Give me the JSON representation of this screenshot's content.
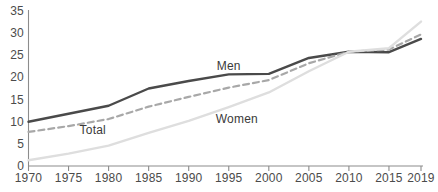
{
  "chart_data": {
    "type": "line",
    "title": "",
    "subtitle": "",
    "xlabel": "",
    "ylabel": "",
    "xlim": [
      1970,
      2019
    ],
    "ylim": [
      0,
      35
    ],
    "grid": false,
    "legend_position": "inline-annotations",
    "x": [
      1970,
      1975,
      1980,
      1985,
      1990,
      1995,
      2000,
      2005,
      2010,
      2015,
      2019
    ],
    "xtick_labels": [
      "1970",
      "1975",
      "1980",
      "1985",
      "1990",
      "1995",
      "2000",
      "2005",
      "2010",
      "2015",
      "2019"
    ],
    "ytick_labels": [
      "0",
      "5",
      "10",
      "15",
      "20",
      "25",
      "30",
      "35"
    ],
    "yticks": [
      0,
      5,
      10,
      15,
      20,
      25,
      30,
      35
    ],
    "series": [
      {
        "name": "Men",
        "style": "solid",
        "color": "#4a4a4a",
        "width": 2.4,
        "label_text": "Men",
        "values": [
          10.0,
          11.8,
          13.6,
          17.5,
          19.2,
          20.7,
          20.8,
          24.4,
          25.8,
          25.7,
          28.7
        ]
      },
      {
        "name": "Total",
        "style": "dashed",
        "color": "#a8a8a8",
        "width": 2.2,
        "label_text": "Total",
        "values": [
          7.7,
          9.0,
          10.6,
          13.4,
          15.6,
          17.7,
          19.4,
          23.2,
          25.8,
          26.3,
          29.7
        ]
      },
      {
        "name": "Women",
        "style": "solid",
        "color": "#dedede",
        "width": 2.4,
        "label_text": "Women",
        "values": [
          1.3,
          2.8,
          4.6,
          7.5,
          10.2,
          13.3,
          16.6,
          21.4,
          25.8,
          26.6,
          32.6
        ]
      }
    ],
    "annotations": [
      {
        "text": "Men",
        "x": 1995,
        "y": 22.6
      },
      {
        "text": "Women",
        "x": 1996,
        "y": 10.6
      },
      {
        "text": "Total",
        "x": 1978,
        "y": 8.2
      }
    ]
  },
  "axis": {
    "axis_color": "#8c8c8c",
    "tick_color": "#8c8c8c",
    "label_color": "#4b4b4b"
  }
}
